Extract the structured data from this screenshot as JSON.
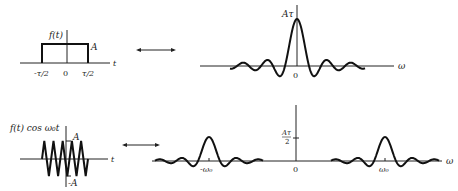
{
  "top_left": {
    "ylabel": "f(t)",
    "amp_label": "A",
    "t_label": "t",
    "neg_tick": "-τ/2",
    "zero": "0",
    "pos_tick": "τ/2"
  },
  "top_right": {
    "peak_label": "Aτ",
    "zero": "0",
    "axis_label": "ω"
  },
  "bottom_left": {
    "ylabel": "f(t) cos ω₀t",
    "pos_amp": "A",
    "neg_amp": "-A",
    "t_label": "t"
  },
  "bottom_right": {
    "peak_label_num": "Aτ",
    "peak_label_den": "2",
    "neg_center": "-ω₀",
    "zero": "0",
    "pos_center": "ω₀",
    "axis_label": "ω"
  },
  "arrows": {
    "top": "transform-pair",
    "bottom": "transform-pair"
  }
}
